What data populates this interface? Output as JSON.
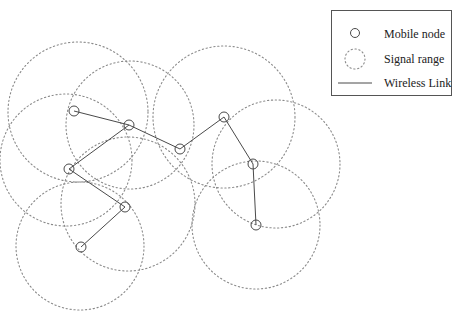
{
  "diagram": {
    "colors": {
      "range": "#8a8a8a",
      "link": "#4a4a4a",
      "node": "#4a4a4a"
    },
    "nodes": [
      {
        "id": "n1",
        "x": 74,
        "y": 111,
        "range_r": 70
      },
      {
        "id": "n2",
        "x": 129,
        "y": 125,
        "range_r": 64
      },
      {
        "id": "n3",
        "x": 180,
        "y": 149,
        "range_r": 0
      },
      {
        "id": "n4",
        "x": 224,
        "y": 117,
        "range_r": 71
      },
      {
        "id": "n5",
        "x": 253,
        "y": 164,
        "range_r": 84
      },
      {
        "id": "n6",
        "x": 256,
        "y": 225,
        "range_r": 64
      },
      {
        "id": "n7",
        "x": 69,
        "y": 169,
        "range_r": 66
      },
      {
        "id": "n8",
        "x": 125,
        "y": 207,
        "range_r": 67
      },
      {
        "id": "n9",
        "x": 81,
        "y": 247,
        "range_r": 64
      }
    ],
    "ranges": [
      {
        "cx": 78,
        "cy": 112,
        "r": 70
      },
      {
        "cx": 130,
        "cy": 125,
        "r": 64
      },
      {
        "cx": 224,
        "cy": 117,
        "r": 71
      },
      {
        "cx": 276,
        "cy": 164,
        "r": 64
      },
      {
        "cx": 256,
        "cy": 225,
        "r": 64
      },
      {
        "cx": 66,
        "cy": 160,
        "r": 66
      },
      {
        "cx": 128,
        "cy": 204,
        "r": 67
      },
      {
        "cx": 80,
        "cy": 246,
        "r": 64
      }
    ],
    "links": [
      [
        "n1",
        "n2"
      ],
      [
        "n2",
        "n3"
      ],
      [
        "n3",
        "n4"
      ],
      [
        "n4",
        "n5"
      ],
      [
        "n5",
        "n6"
      ],
      [
        "n2",
        "n7"
      ],
      [
        "n7",
        "n8"
      ],
      [
        "n8",
        "n9"
      ]
    ]
  },
  "legend": {
    "items": [
      {
        "icon": "mobile-node-icon",
        "label": "Mobile node"
      },
      {
        "icon": "signal-range-icon",
        "label": "Signal range"
      },
      {
        "icon": "wireless-link-icon",
        "label": "Wireless Link"
      }
    ]
  }
}
